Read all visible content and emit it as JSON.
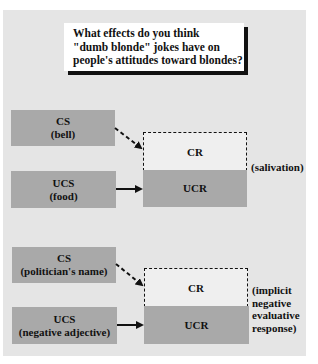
{
  "question": {
    "lines": [
      "What effects do you think",
      "\"dumb blonde\" jokes have on",
      "people's attitudes toward blondes?"
    ]
  },
  "diagrams": [
    {
      "cs": {
        "title": "CS",
        "subtitle": "(bell)"
      },
      "ucs": {
        "title": "UCS",
        "subtitle": "(food)"
      },
      "cr": "CR",
      "ucr": "UCR",
      "response_label": [
        "(salivation)"
      ]
    },
    {
      "cs": {
        "title": "CS",
        "subtitle": "(politician's name)"
      },
      "ucs": {
        "title": "UCS",
        "subtitle": "(negative adjective)"
      },
      "cr": "CR",
      "ucr": "UCR",
      "response_label": [
        "(implicit",
        "negative",
        "evaluative",
        "response)"
      ]
    }
  ],
  "colors": {
    "panel": "#e5e5e5",
    "box": "#a9a9a9",
    "cr_fill": "#efefef",
    "ink": "#111111"
  }
}
